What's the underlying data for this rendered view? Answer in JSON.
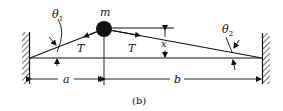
{
  "figure": {
    "caption": "(b)",
    "labels": {
      "mass": "m",
      "theta1": "θ",
      "theta1_sub": "1",
      "theta2": "θ",
      "theta2_sub": "2",
      "tension_left": "T",
      "tension_right": "T",
      "displacement": "x",
      "dist_left": "a",
      "dist_right": "b"
    },
    "colors": {
      "ink": "#111111",
      "background": "#ffffff"
    }
  }
}
